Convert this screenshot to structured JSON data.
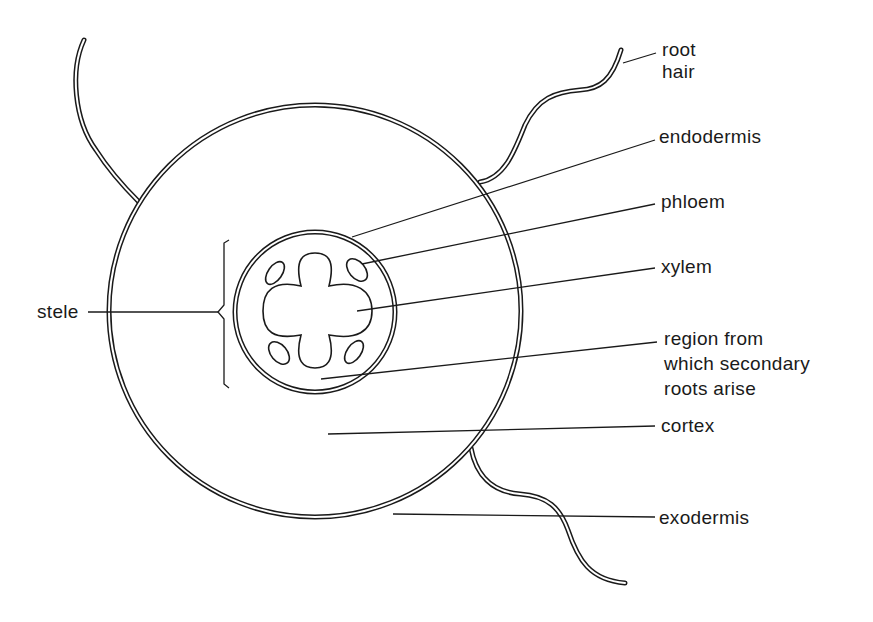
{
  "figure": {
    "type": "labelled cross-section diagram"
  },
  "labels": {
    "root_hair_line1": "root",
    "root_hair_line2": "hair",
    "endodermis": "endodermis",
    "phloem": "phloem",
    "xylem": "xylem",
    "region_line1": "region from",
    "region_line2": "which secondary",
    "region_line3": "roots arise",
    "cortex": "cortex",
    "exodermis": "exodermis",
    "stele": "stele"
  },
  "colors": {
    "ink": "#1a1a1a",
    "background": "#ffffff"
  }
}
